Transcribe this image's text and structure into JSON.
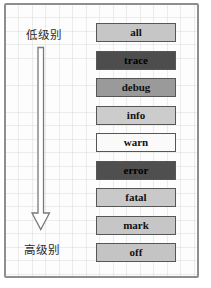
{
  "diagram": {
    "left_axis": {
      "top_label": "低级别",
      "bottom_label": "高级别",
      "arrow_direction": "down"
    },
    "levels": [
      {
        "label": "all",
        "fill": "#c6c6c6",
        "text_color": "#111111"
      },
      {
        "label": "trace",
        "fill": "#4d4d4d",
        "text_color": "#000000"
      },
      {
        "label": "debug",
        "fill": "#9a9a9a",
        "text_color": "#111111"
      },
      {
        "label": "info",
        "fill": "#cccccc",
        "text_color": "#111111"
      },
      {
        "label": "warn",
        "fill": "#fafafa",
        "text_color": "#111111"
      },
      {
        "label": "error",
        "fill": "#4f4f4f",
        "text_color": "#000000"
      },
      {
        "label": "fatal",
        "fill": "#c9c9c9",
        "text_color": "#111111"
      },
      {
        "label": "mark",
        "fill": "#c6c6c6",
        "text_color": "#111111"
      },
      {
        "label": "off",
        "fill": "#c4c4c4",
        "text_color": "#111111"
      }
    ],
    "colors": {
      "frame_border": "#8e8e8e",
      "box_border": "#565656",
      "background": "#fdfdfd",
      "grid_line": "#dfe5dd",
      "arrow_outline": "#7a7a7a"
    }
  }
}
